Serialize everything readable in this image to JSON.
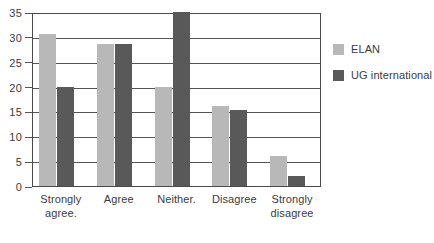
{
  "chart_data": {
    "type": "bar",
    "title": "",
    "xlabel": "",
    "ylabel": "",
    "ylim": [
      0,
      35
    ],
    "yticks": [
      0,
      5,
      10,
      15,
      20,
      25,
      30,
      35
    ],
    "grid": true,
    "legend_position": "right",
    "categories": [
      "Strongly agree.",
      "Agree",
      "Neither.",
      "Disagree",
      "Strongly disagree"
    ],
    "category_lines": [
      [
        "Strongly",
        "agree."
      ],
      [
        "Agree"
      ],
      [
        "Neither."
      ],
      [
        "Disagree"
      ],
      [
        "Strongly",
        "disagree"
      ]
    ],
    "series": [
      {
        "name": "ELAN",
        "color": "#b8b8b8",
        "values": [
          30.5,
          28.5,
          20,
          16,
          6
        ]
      },
      {
        "name": "UG international",
        "color": "#595959",
        "values": [
          20,
          28.5,
          35,
          15.2,
          2
        ]
      }
    ]
  },
  "axis": {
    "tick_labels": [
      "0",
      "5",
      "10",
      "15",
      "20",
      "25",
      "30",
      "35"
    ]
  },
  "legend": {
    "items": [
      {
        "label": "ELAN",
        "color": "#b8b8b8"
      },
      {
        "label": "UG international",
        "color": "#595959"
      }
    ]
  },
  "colors": {
    "series_elan": "#b8b8b8",
    "series_ug": "#595959",
    "axis": "#4a4a4a",
    "gridline": "#555555",
    "text": "#3c3c3c",
    "background": "#ffffff"
  }
}
